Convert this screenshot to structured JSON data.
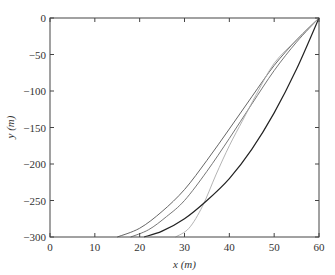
{
  "chart_data": {
    "type": "line",
    "title": "",
    "xlabel": "x (m)",
    "ylabel": "y (m)",
    "xlim": [
      0,
      60
    ],
    "ylim": [
      -300,
      0
    ],
    "xticks": [
      0,
      10,
      20,
      30,
      40,
      50,
      60
    ],
    "yticks": [
      0,
      -50,
      -100,
      -150,
      -200,
      -250,
      -300
    ],
    "grid": false,
    "legend": null,
    "series": [
      {
        "name": "curve-1",
        "color": "#555555",
        "x": [
          15,
          20,
          25,
          30,
          35,
          40,
          45,
          50,
          55,
          60
        ],
        "y": [
          -300,
          -288,
          -265,
          -235,
          -195,
          -152,
          -108,
          -65,
          -30,
          0
        ]
      },
      {
        "name": "curve-2",
        "color": "#666666",
        "x": [
          18,
          22,
          26,
          30,
          35,
          40,
          45,
          50,
          55,
          60
        ],
        "y": [
          -300,
          -290,
          -272,
          -250,
          -210,
          -165,
          -118,
          -72,
          -33,
          0
        ]
      },
      {
        "name": "curve-3",
        "color": "#aaaaaa",
        "x": [
          28,
          31,
          34,
          37,
          40,
          43,
          46,
          50,
          55,
          60
        ],
        "y": [
          -300,
          -288,
          -258,
          -215,
          -175,
          -140,
          -105,
          -62,
          -30,
          0
        ]
      },
      {
        "name": "curve-4",
        "color": "#222222",
        "x": [
          21,
          25,
          30,
          35,
          40,
          45,
          50,
          55,
          60
        ],
        "y": [
          -300,
          -292,
          -275,
          -250,
          -220,
          -180,
          -130,
          -70,
          0
        ]
      }
    ]
  }
}
